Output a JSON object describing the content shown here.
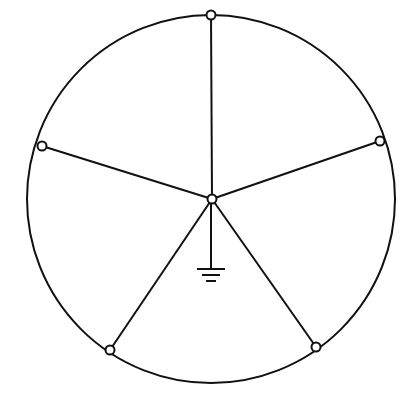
{
  "diagram": {
    "title": "",
    "colors": {
      "background": "#ffffff",
      "stroke": "#111111",
      "node_fill": "#ffffff"
    },
    "outer_circle": {
      "cx": 211,
      "cy": 199,
      "r": 184
    },
    "center_node": {
      "id": "center",
      "x": 212,
      "y": 199
    },
    "nodes": [
      {
        "id": "top",
        "x": 211,
        "y": 15
      },
      {
        "id": "right",
        "x": 380,
        "y": 141
      },
      {
        "id": "bottom-right",
        "x": 316,
        "y": 347
      },
      {
        "id": "bottom-left",
        "x": 110,
        "y": 350
      },
      {
        "id": "left",
        "x": 42,
        "y": 146
      }
    ],
    "ground": {
      "symbol": "ground-icon",
      "x": 211,
      "lead_end_y": 269,
      "bars": [
        {
          "y": 269,
          "half_width": 14
        },
        {
          "y": 275,
          "half_width": 9
        },
        {
          "y": 281,
          "half_width": 5
        }
      ]
    },
    "node_radius": 4.5,
    "stroke_width": 2
  }
}
